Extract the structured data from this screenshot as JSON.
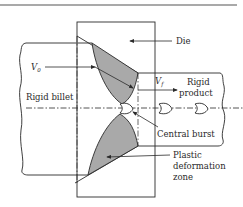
{
  "diagram": {
    "type": "extrusion central burst schematic",
    "labels": {
      "die": "Die",
      "v0_symbol": "V",
      "v0_subscript": "0",
      "vf_symbol": "V",
      "vf_subscript": "f",
      "rigid_billet": "Rigid billet",
      "rigid_product_line1": "Rigid",
      "rigid_product_line2": "product",
      "central_burst": "Central burst",
      "plastic_line1": "Plastic",
      "plastic_line2": "deformation",
      "plastic_line3": "zone"
    },
    "colors": {
      "line": "#2a2a2a",
      "deformation_zone_fill": "#a9a9a9",
      "top_rule": "#555555",
      "background": "#ffffff"
    }
  }
}
